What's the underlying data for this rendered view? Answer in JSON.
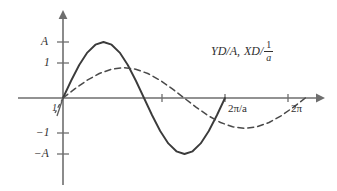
{
  "figure": {
    "title": "",
    "background_color": "#ffffff",
    "axis_color": "#6e6e6e",
    "solid_curve_color": "#3b3b3b",
    "dashed_curve_color": "#4a4a4a"
  },
  "labels": {
    "y_positive_amplitude": "A",
    "y_positive_one": "1",
    "y_negative_one": "−1",
    "y_negative_amplitude": "−A",
    "x_first_period": "2π/a",
    "x_second_period": "2π",
    "origin_mark": "1"
  },
  "annotation": {
    "part1": "YD/A,",
    "part2": "XD/",
    "fraction_numerator": "1",
    "fraction_denominator": "a",
    "full_text": "YD/A, XD/(1/a)"
  },
  "chart_data": {
    "type": "line",
    "title": "",
    "xlabel": "",
    "ylabel": "",
    "grid": false,
    "legend": "none",
    "xlim": [
      0,
      7.6
    ],
    "ylim": [
      -2.1,
      2.1
    ],
    "x_tick_labels": [
      "2π/a",
      "2π"
    ],
    "x_tick_values": [
      4.2,
      6.283
    ],
    "y_tick_labels": [
      "A",
      "1",
      "−1",
      "−A"
    ],
    "y_tick_values": [
      1.85,
      1.0,
      -1.0,
      -1.85
    ],
    "series": [
      {
        "name": "YD/A",
        "style": "solid",
        "amplitude": 1.85,
        "period": 4.2,
        "function": "A*sin(a*x)",
        "x": [
          0.0,
          0.21,
          0.42,
          0.63,
          0.84,
          1.05,
          1.26,
          1.47,
          1.68,
          1.89,
          2.1,
          2.31,
          2.52,
          2.73,
          2.94,
          3.15,
          3.36,
          3.57,
          3.78,
          3.99,
          4.2
        ],
        "y": [
          0.0,
          0.57,
          1.09,
          1.5,
          1.76,
          1.85,
          1.76,
          1.5,
          1.09,
          0.57,
          0.0,
          -0.57,
          -1.09,
          -1.5,
          -1.76,
          -1.85,
          -1.76,
          -1.5,
          -1.09,
          -0.57,
          0.0
        ]
      },
      {
        "name": "XD/(1/a)",
        "style": "dashed",
        "amplitude": 1.0,
        "period": 6.283,
        "function": "sin(x)",
        "x": [
          0.0,
          0.314,
          0.628,
          0.942,
          1.257,
          1.571,
          1.885,
          2.199,
          2.513,
          2.827,
          3.142,
          3.456,
          3.77,
          4.084,
          4.398,
          4.712,
          5.027,
          5.341,
          5.655,
          5.969,
          6.283
        ],
        "y": [
          0.0,
          0.309,
          0.588,
          0.809,
          0.951,
          1.0,
          0.951,
          0.809,
          0.588,
          0.309,
          0.0,
          -0.309,
          -0.588,
          -0.809,
          -0.951,
          -1.0,
          -0.951,
          -0.809,
          -0.588,
          -0.309,
          0.0
        ]
      }
    ]
  }
}
